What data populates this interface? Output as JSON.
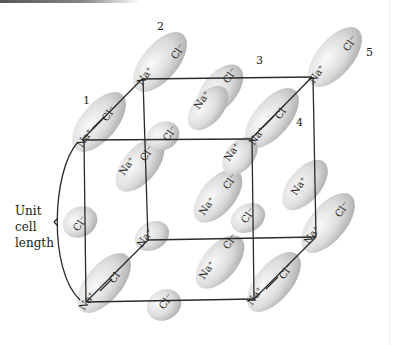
{
  "figure": {
    "ion_labels": {
      "sodium": "Na⁺",
      "chloride": "Cl⁻"
    },
    "molecule_numbers": [
      "1",
      "2",
      "3",
      "4",
      "5"
    ],
    "side_label": [
      "Unit",
      "cell",
      "length"
    ],
    "colors": {
      "ion_fill": "#c9c9c9",
      "ion_highlight": "#f4f4f4",
      "line": "#2a2a2a"
    }
  }
}
